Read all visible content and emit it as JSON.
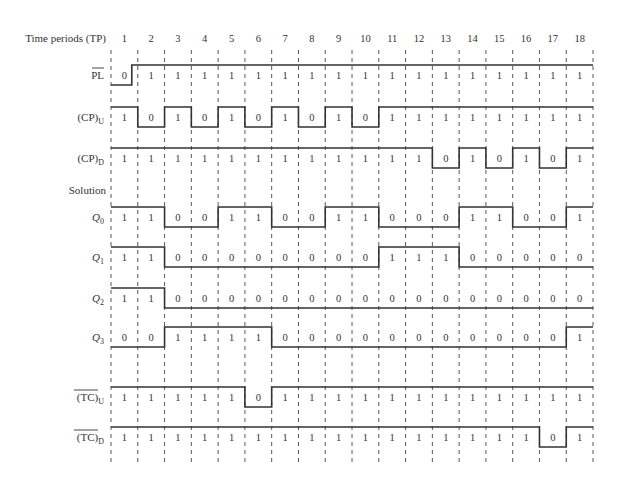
{
  "diagram": {
    "header_label": "Time periods (TP)",
    "time_periods": [
      "1",
      "2",
      "3",
      "4",
      "5",
      "6",
      "7",
      "8",
      "9",
      "10",
      "11",
      "12",
      "13",
      "14",
      "15",
      "16",
      "17",
      "18"
    ],
    "solution_label": "Solution",
    "signals": [
      {
        "id": "PL",
        "label": "PL",
        "subscript": "",
        "overline": true,
        "label_style": "roman",
        "values": [
          0,
          1,
          1,
          1,
          1,
          1,
          1,
          1,
          1,
          1,
          1,
          1,
          1,
          1,
          1,
          1,
          1,
          1
        ],
        "transition_offset": [
          -6
        ]
      },
      {
        "id": "CP_U",
        "label": "(CP)",
        "subscript": "U",
        "overline": false,
        "label_style": "roman",
        "values": [
          1,
          0,
          1,
          0,
          1,
          0,
          1,
          0,
          1,
          0,
          1,
          1,
          1,
          1,
          1,
          1,
          1,
          1
        ]
      },
      {
        "id": "CP_D",
        "label": "(CP)",
        "subscript": "D",
        "overline": false,
        "label_style": "roman",
        "values": [
          1,
          1,
          1,
          1,
          1,
          1,
          1,
          1,
          1,
          1,
          1,
          1,
          0,
          1,
          0,
          1,
          0,
          1
        ]
      },
      {
        "id": "Q0",
        "label": "Q",
        "subscript": "0",
        "overline": false,
        "label_style": "italic",
        "values": [
          1,
          1,
          0,
          0,
          1,
          1,
          0,
          0,
          1,
          1,
          0,
          0,
          0,
          1,
          1,
          0,
          0,
          1
        ]
      },
      {
        "id": "Q1",
        "label": "Q",
        "subscript": "1",
        "overline": false,
        "label_style": "italic",
        "values": [
          1,
          1,
          0,
          0,
          0,
          0,
          0,
          0,
          0,
          0,
          1,
          1,
          1,
          0,
          0,
          0,
          0,
          0
        ]
      },
      {
        "id": "Q2",
        "label": "Q",
        "subscript": "2",
        "overline": false,
        "label_style": "italic",
        "values": [
          1,
          1,
          0,
          0,
          0,
          0,
          0,
          0,
          0,
          0,
          0,
          0,
          0,
          0,
          0,
          0,
          0,
          0
        ]
      },
      {
        "id": "Q3",
        "label": "Q",
        "subscript": "3",
        "overline": false,
        "label_style": "italic",
        "values": [
          0,
          0,
          1,
          1,
          1,
          1,
          0,
          0,
          0,
          0,
          0,
          0,
          0,
          0,
          0,
          0,
          0,
          1
        ]
      },
      {
        "id": "TC_U",
        "label": "(TC)",
        "subscript": "U",
        "overline": true,
        "label_style": "roman",
        "values": [
          1,
          1,
          1,
          1,
          1,
          0,
          1,
          1,
          1,
          1,
          1,
          1,
          1,
          1,
          1,
          1,
          1,
          1
        ]
      },
      {
        "id": "TC_D",
        "label": "(TC)",
        "subscript": "D",
        "overline": true,
        "label_style": "roman",
        "values": [
          1,
          1,
          1,
          1,
          1,
          1,
          1,
          1,
          1,
          1,
          1,
          1,
          1,
          1,
          1,
          1,
          0,
          1
        ]
      }
    ],
    "colors": {
      "line": "#333333",
      "background": "#ffffff"
    }
  }
}
